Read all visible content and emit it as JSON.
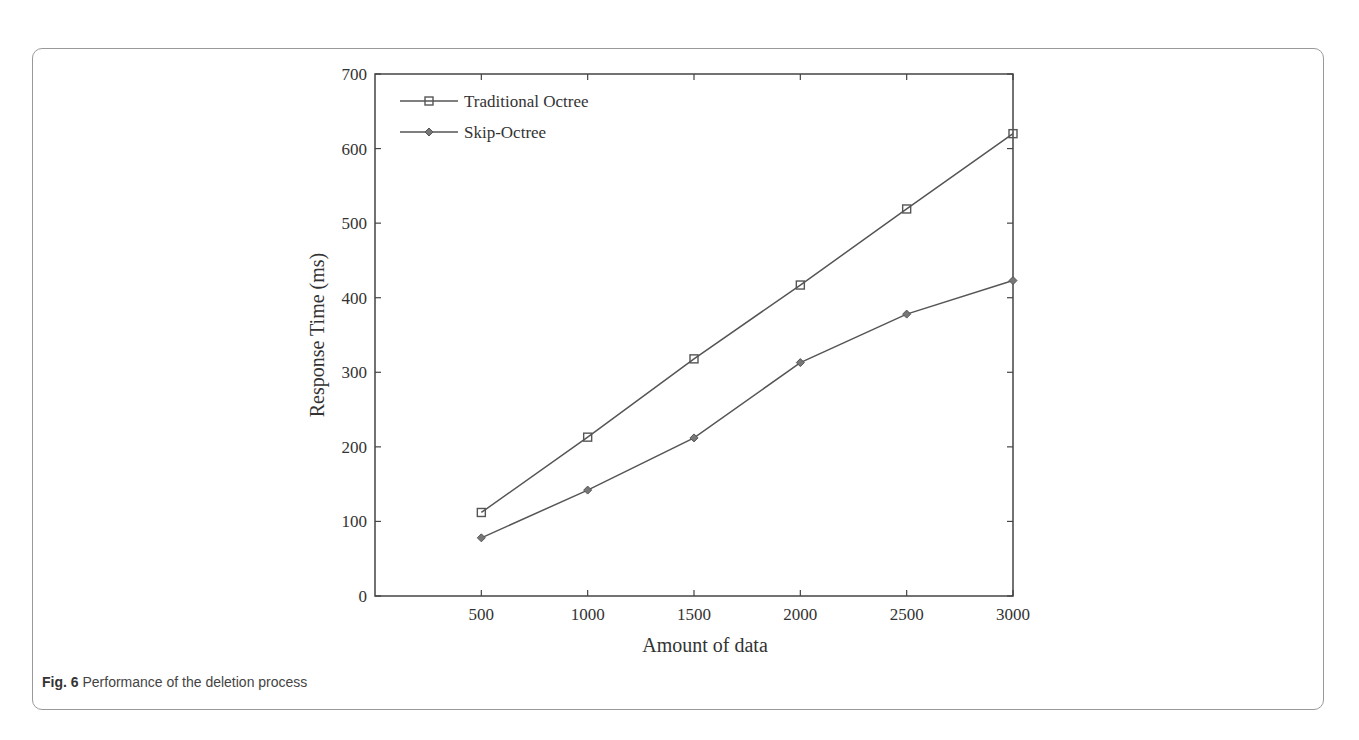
{
  "caption": {
    "label": "Fig. 6",
    "text": " Performance of the deletion process"
  },
  "chart_data": {
    "type": "line",
    "title": "",
    "xlabel": "Amount of data",
    "ylabel": "Response Time (ms)",
    "x": [
      500,
      1000,
      1500,
      2000,
      2500,
      3000
    ],
    "xticks": [
      "500",
      "1000",
      "1500",
      "2000",
      "2500",
      "3000"
    ],
    "yticks": [
      "0",
      "100",
      "200",
      "300",
      "400",
      "500",
      "600",
      "700"
    ],
    "ylim": [
      0,
      700
    ],
    "xlim": [
      0,
      3000
    ],
    "grid": false,
    "legend_position": "upper left",
    "series": [
      {
        "name": "Traditional Octree",
        "marker": "square",
        "values": [
          112,
          213,
          318,
          417,
          519,
          620
        ]
      },
      {
        "name": "Skip-Octree",
        "marker": "diamond",
        "values": [
          78,
          142,
          212,
          313,
          378,
          423
        ]
      }
    ]
  }
}
